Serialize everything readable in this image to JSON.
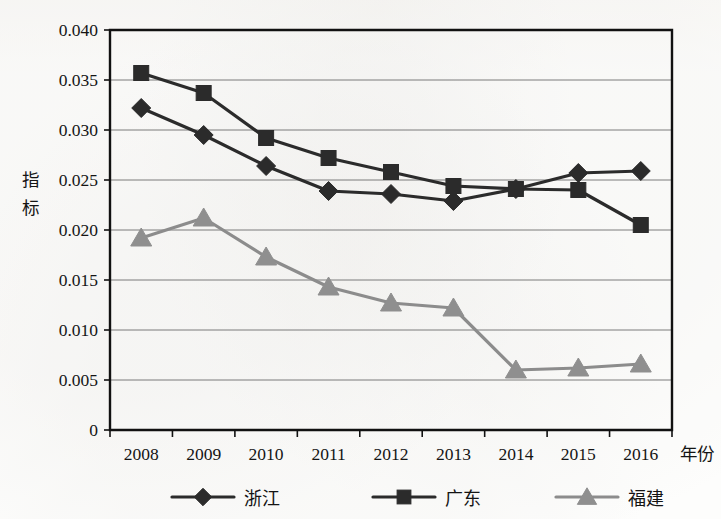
{
  "chart_data": {
    "type": "line",
    "title": "",
    "xlabel": "年份",
    "ylabel": "指标",
    "x": [
      "2008",
      "2009",
      "2010",
      "2011",
      "2012",
      "2013",
      "2014",
      "2015",
      "2016"
    ],
    "categories": [
      "2008",
      "2009",
      "2010",
      "2011",
      "2012",
      "2013",
      "2014",
      "2015",
      "2016"
    ],
    "ylim": [
      0,
      0.04
    ],
    "yticks": [
      "0",
      "0.005",
      "0.010",
      "0.015",
      "0.020",
      "0.025",
      "0.030",
      "0.035",
      "0.040"
    ],
    "ytick_values": [
      0,
      0.005,
      0.01,
      0.015,
      0.02,
      0.025,
      0.03,
      0.035,
      0.04
    ],
    "grid": true,
    "legend_position": "bottom",
    "series": [
      {
        "name": "浙江",
        "marker": "diamond",
        "color": "#2b2b2b",
        "values": [
          0.0322,
          0.0295,
          0.0264,
          0.0239,
          0.0236,
          0.0229,
          0.0241,
          0.0257,
          0.0259
        ]
      },
      {
        "name": "广东",
        "marker": "square",
        "color": "#2b2b2b",
        "values": [
          0.0357,
          0.0337,
          0.0292,
          0.0272,
          0.0258,
          0.0244,
          0.0241,
          0.024,
          0.0205
        ]
      },
      {
        "name": "福建",
        "marker": "triangle",
        "color": "#8f8f8f",
        "values": [
          0.0192,
          0.0212,
          0.0173,
          0.0143,
          0.0127,
          0.0122,
          0.006,
          0.0062,
          0.0066
        ]
      }
    ]
  },
  "legend": {
    "items": [
      {
        "label": "浙江",
        "marker": "diamond",
        "color": "#2b2b2b"
      },
      {
        "label": "广东",
        "marker": "square",
        "color": "#2b2b2b"
      },
      {
        "label": "福建",
        "marker": "triangle",
        "color": "#8f8f8f"
      }
    ]
  },
  "axes": {
    "y_title_chars": [
      "指",
      "标"
    ],
    "x_title": "年份"
  }
}
